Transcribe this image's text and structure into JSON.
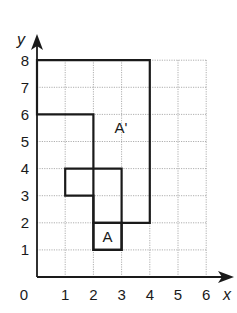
{
  "figure": {
    "axes": {
      "x_label": "x",
      "y_label": "y",
      "origin_label": "0",
      "x_ticks": [
        "1",
        "2",
        "3",
        "4",
        "5",
        "6"
      ],
      "y_ticks": [
        "1",
        "2",
        "3",
        "4",
        "5",
        "6",
        "7",
        "8"
      ],
      "x_range": [
        0,
        6
      ],
      "y_range": [
        0,
        8
      ],
      "grid": "dotted, unit squares"
    },
    "shapes": [
      {
        "name": "A",
        "label": "A",
        "vertices": [
          [
            2,
            1
          ],
          [
            3,
            1
          ],
          [
            3,
            2
          ],
          [
            2,
            2
          ]
        ]
      },
      {
        "name": "intermediate",
        "label": "",
        "vertices": [
          [
            1,
            4
          ],
          [
            3,
            4
          ],
          [
            3,
            1
          ],
          [
            2,
            1
          ],
          [
            2,
            3
          ],
          [
            1,
            3
          ]
        ]
      },
      {
        "name": "A-prime",
        "label": "A'",
        "vertices": [
          [
            0,
            8
          ],
          [
            4,
            8
          ],
          [
            4,
            2
          ],
          [
            2,
            2
          ],
          [
            2,
            6
          ],
          [
            0,
            6
          ]
        ]
      }
    ]
  }
}
